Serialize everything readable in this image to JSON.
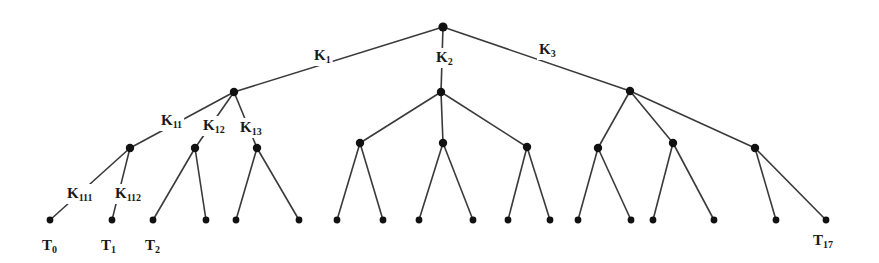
{
  "diagram": {
    "type": "tree",
    "colors": {
      "edge": "#3a3a3a",
      "node": "#111111",
      "text": "#1a1a1a",
      "background": "#ffffff"
    },
    "nodes": [
      {
        "id": "root",
        "x": 443,
        "y": 27
      },
      {
        "id": "n1",
        "x": 234,
        "y": 92
      },
      {
        "id": "n2",
        "x": 441,
        "y": 92
      },
      {
        "id": "n3",
        "x": 630,
        "y": 91
      },
      {
        "id": "n11",
        "x": 130,
        "y": 148
      },
      {
        "id": "n12",
        "x": 195,
        "y": 148
      },
      {
        "id": "n13",
        "x": 257,
        "y": 148
      },
      {
        "id": "n21",
        "x": 360,
        "y": 143
      },
      {
        "id": "n22",
        "x": 443,
        "y": 143
      },
      {
        "id": "n23",
        "x": 527,
        "y": 147
      },
      {
        "id": "n31",
        "x": 598,
        "y": 148
      },
      {
        "id": "n32",
        "x": 673,
        "y": 143
      },
      {
        "id": "n33",
        "x": 755,
        "y": 148
      },
      {
        "id": "t0",
        "x": 50,
        "y": 220
      },
      {
        "id": "t1",
        "x": 112,
        "y": 220
      },
      {
        "id": "t2",
        "x": 153,
        "y": 220
      },
      {
        "id": "t3",
        "x": 206,
        "y": 220
      },
      {
        "id": "t4",
        "x": 236,
        "y": 220
      },
      {
        "id": "t5",
        "x": 299,
        "y": 220
      },
      {
        "id": "t6",
        "x": 337,
        "y": 220
      },
      {
        "id": "t7",
        "x": 383,
        "y": 220
      },
      {
        "id": "t8",
        "x": 419,
        "y": 220
      },
      {
        "id": "t9",
        "x": 473,
        "y": 220
      },
      {
        "id": "t10",
        "x": 508,
        "y": 220
      },
      {
        "id": "t11",
        "x": 550,
        "y": 220
      },
      {
        "id": "t12",
        "x": 578,
        "y": 220
      },
      {
        "id": "t13",
        "x": 631,
        "y": 220
      },
      {
        "id": "t14",
        "x": 653,
        "y": 220
      },
      {
        "id": "t15",
        "x": 714,
        "y": 220
      },
      {
        "id": "t16",
        "x": 776,
        "y": 220
      },
      {
        "id": "t17",
        "x": 826,
        "y": 220
      }
    ],
    "edges": [
      [
        "root",
        "n1"
      ],
      [
        "root",
        "n2"
      ],
      [
        "root",
        "n3"
      ],
      [
        "n1",
        "n11"
      ],
      [
        "n1",
        "n12"
      ],
      [
        "n1",
        "n13"
      ],
      [
        "n2",
        "n21"
      ],
      [
        "n2",
        "n22"
      ],
      [
        "n2",
        "n23"
      ],
      [
        "n3",
        "n31"
      ],
      [
        "n3",
        "n32"
      ],
      [
        "n3",
        "n33"
      ],
      [
        "n11",
        "t0"
      ],
      [
        "n11",
        "t1"
      ],
      [
        "n12",
        "t2"
      ],
      [
        "n12",
        "t3"
      ],
      [
        "n13",
        "t4"
      ],
      [
        "n13",
        "t5"
      ],
      [
        "n21",
        "t6"
      ],
      [
        "n21",
        "t7"
      ],
      [
        "n22",
        "t8"
      ],
      [
        "n22",
        "t9"
      ],
      [
        "n23",
        "t10"
      ],
      [
        "n23",
        "t11"
      ],
      [
        "n31",
        "t12"
      ],
      [
        "n31",
        "t13"
      ],
      [
        "n32",
        "t14"
      ],
      [
        "n32",
        "t15"
      ],
      [
        "n33",
        "t16"
      ],
      [
        "n33",
        "t17"
      ]
    ],
    "edge_labels": [
      {
        "name": "k1",
        "base": "K",
        "sub": "1",
        "x": 314,
        "y": 60
      },
      {
        "name": "k2",
        "base": "K",
        "sub": "2",
        "x": 436,
        "y": 62
      },
      {
        "name": "k3",
        "base": "K",
        "sub": "3",
        "x": 539,
        "y": 54
      },
      {
        "name": "k11",
        "base": "K",
        "sub": "11",
        "x": 161,
        "y": 125
      },
      {
        "name": "k12",
        "base": "K",
        "sub": "12",
        "x": 203,
        "y": 130
      },
      {
        "name": "k13",
        "base": "K",
        "sub": "13",
        "x": 240,
        "y": 132
      },
      {
        "name": "k111",
        "base": "K",
        "sub": "111",
        "x": 67,
        "y": 198
      },
      {
        "name": "k112",
        "base": "K",
        "sub": "112",
        "x": 115,
        "y": 198
      }
    ],
    "leaf_labels": [
      {
        "name": "t0",
        "base": "T",
        "sub": "0",
        "x": 42,
        "y": 250
      },
      {
        "name": "t1",
        "base": "T",
        "sub": "1",
        "x": 101,
        "y": 250
      },
      {
        "name": "t2",
        "base": "T",
        "sub": "2",
        "x": 145,
        "y": 250
      },
      {
        "name": "t17",
        "base": "T",
        "sub": "17",
        "x": 813,
        "y": 245
      }
    ]
  }
}
